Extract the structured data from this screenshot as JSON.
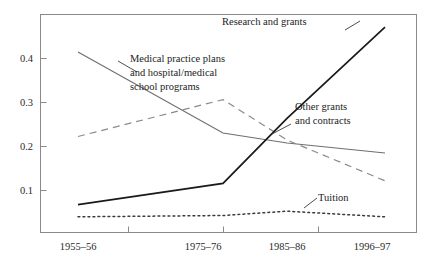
{
  "chart_data": {
    "type": "line",
    "title": "",
    "subtitle": "",
    "xlabel": "",
    "ylabel": "",
    "grid": false,
    "legend_position": "inline-annotations",
    "categories": [
      "1955–56",
      "1975–76",
      "1985–86",
      "1996–97"
    ],
    "x_tick_labels": [
      "1955–56",
      "1975–76",
      "1985–86",
      "1996–97"
    ],
    "y_tick_labels": [
      "0.1",
      "0.2",
      "0.3",
      "0.4"
    ],
    "y_tick_values": [
      0.1,
      0.2,
      0.3,
      0.4
    ],
    "ylim": [
      0.0,
      0.5
    ],
    "xlim_categories": [
      "1955–56",
      "1996–97"
    ],
    "series": [
      {
        "name": "Medical practice plans and hospital/medical school programs",
        "label": "Medical practice plans\nand hospital/medical\nschool programs",
        "style": "solid-gray",
        "color": "#6f6f6f",
        "values": [
          0.415,
          0.228,
          0.205,
          0.182
        ]
      },
      {
        "name": "Research and grants",
        "label": "Research and grants",
        "style": "solid-black",
        "color": "#1a1a1a",
        "values": [
          0.063,
          0.112,
          0.262,
          0.472
        ]
      },
      {
        "name": "Other grants and contracts",
        "label": "Other grants and contracts",
        "style": "dashed",
        "color": "#8a8a8a",
        "values": [
          0.22,
          0.305,
          0.212,
          0.118
        ]
      },
      {
        "name": "Tuition",
        "label": "Tuition",
        "style": "dotted",
        "color": "#3a3a3a",
        "values": [
          0.035,
          0.038,
          0.048,
          0.035
        ]
      }
    ],
    "annotations": [
      {
        "id": "research-and-grants",
        "text": "Research and grants",
        "lines": [
          "Research and grants"
        ]
      },
      {
        "id": "medical-practice-plans",
        "text": "Medical practice plans and hospital/medical school programs",
        "lines": [
          "Medical practice plans",
          "and hospital/medical",
          "school programs"
        ]
      },
      {
        "id": "other-grants-and-contracts",
        "text": "Other grants and contracts",
        "lines": [
          "Other grants",
          "and contracts"
        ]
      },
      {
        "id": "tuition",
        "text": "Tuition",
        "lines": [
          "Tuition"
        ]
      }
    ]
  },
  "axes": {
    "y_ticks": [
      {
        "label": "0.4",
        "value": 0.4
      },
      {
        "label": "0.3",
        "value": 0.3
      },
      {
        "label": "0.2",
        "value": 0.2
      },
      {
        "label": "0.1",
        "value": 0.1
      }
    ],
    "x_ticks": [
      {
        "label": "1955–56"
      },
      {
        "label": "1975–76"
      },
      {
        "label": "1985–86"
      },
      {
        "label": "1996–97"
      }
    ]
  },
  "labels": {
    "research": "Research and grants",
    "medical_line1": "Medical practice plans",
    "medical_line2": "and hospital/medical",
    "medical_line3": "school programs",
    "other_line1": "Other grants",
    "other_line2": "and contracts",
    "tuition": "Tuition"
  },
  "colors": {
    "frame": "#8a8a8a",
    "text": "#1c1c1c",
    "medical_series": "#6f6f6f",
    "research_series": "#1a1a1a",
    "other_series": "#8a8a8a",
    "tuition_series": "#3a3a3a",
    "background": "#ffffff"
  }
}
